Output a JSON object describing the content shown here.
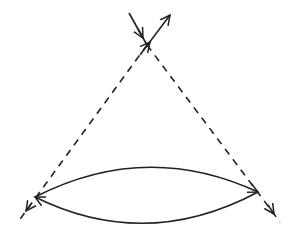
{
  "diagram": {
    "type": "feynman-like loop diagram",
    "background": "#ffffff",
    "stroke_color": "#222222",
    "top_vertex": {
      "x": 147,
      "y": 45
    },
    "left_vertex": {
      "x": 35,
      "y": 197
    },
    "right_vertex": {
      "x": 258,
      "y": 192
    },
    "lines": [
      {
        "id": "incoming-solid",
        "style": "solid",
        "from": [
          129,
          13
        ],
        "to": [
          147,
          45
        ],
        "arrow": "toward-vertex"
      },
      {
        "id": "outgoing-solid",
        "style": "solid",
        "from": [
          147,
          45
        ],
        "to": [
          170,
          15
        ],
        "arrow": "at-end"
      },
      {
        "id": "dashed-left",
        "style": "dashed",
        "from": [
          147,
          45
        ],
        "to": [
          18,
          222
        ],
        "arrow": "near-lower-end"
      },
      {
        "id": "dashed-right",
        "style": "dashed",
        "from": [
          147,
          45
        ],
        "to": [
          280,
          222
        ],
        "arrow": "near-lower-end"
      },
      {
        "id": "upper-arc",
        "style": "solid",
        "from": "left_vertex",
        "to": "right_vertex",
        "arrow": "toward-right-vertex"
      },
      {
        "id": "lower-arc",
        "style": "solid",
        "from": "right_vertex",
        "to": "left_vertex",
        "arrow": "toward-left-vertex"
      }
    ]
  }
}
